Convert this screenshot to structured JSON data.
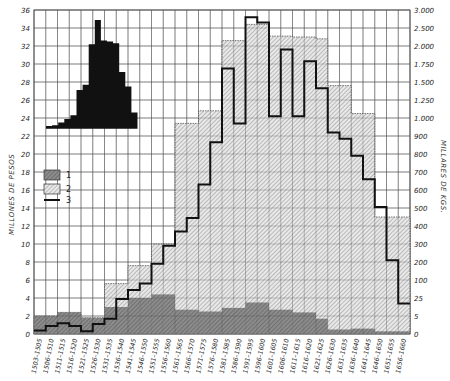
{
  "chart_data": {
    "type": "bar",
    "title": "",
    "xlabel": "",
    "ylabel": "MILLONES DE PESOS",
    "ylabel_right": "MILLARES DE KGS.",
    "ylim": [
      0,
      36
    ],
    "grid": true,
    "y_ticks_left": [
      "0",
      "2",
      "4",
      "6",
      "8",
      "10",
      "12",
      "14",
      "16",
      "18",
      "20",
      "22",
      "24",
      "26",
      "28",
      "30",
      "32",
      "34",
      "36"
    ],
    "y_ticks_right": [
      "0",
      "5",
      "25",
      "100",
      "200",
      "300",
      "400",
      "500",
      "600",
      "700",
      "800",
      "900",
      "1.000",
      "1.250",
      "1.500",
      "1.750",
      "2.000",
      "2.500",
      "3.000"
    ],
    "categories": [
      "1503-1505",
      "1506-1510",
      "1511-1515",
      "1516-1520",
      "1521-1525",
      "1526-1530",
      "1531-1535",
      "1536-1540",
      "1541-1545",
      "1546-1550",
      "1551-1555",
      "1556-1560",
      "1561-1565",
      "1566-1570",
      "1571-1575",
      "1576-1580",
      "1581-1585",
      "1586-1590",
      "1591-1595",
      "1596-1600",
      "1601-1605",
      "1606-1610",
      "1611-1615",
      "1616-1620",
      "1621-1625",
      "1626-1630",
      "1631-1635",
      "1636-1640",
      "1641-1645",
      "1646-1650",
      "1651-1655",
      "1656-1660"
    ],
    "legend": [
      {
        "key": "1",
        "style": "stippled-dark"
      },
      {
        "key": "2",
        "style": "hatched-light"
      },
      {
        "key": "3",
        "style": "thick-line"
      }
    ],
    "series": [
      {
        "name": "1",
        "values": [
          2,
          2,
          2.4,
          2.4,
          1.8,
          1.8,
          3,
          3,
          4,
          4,
          4.4,
          4.4,
          2.7,
          2.7,
          2.5,
          2.5,
          2.9,
          2.9,
          3.5,
          3.5,
          2.7,
          2.7,
          2.4,
          2.4,
          1.7,
          0.5,
          0.5,
          0.6,
          0.6,
          0.3,
          0.3,
          0.3
        ]
      },
      {
        "name": "2",
        "values": [
          2,
          2,
          2.4,
          2.4,
          1.8,
          1.8,
          5.6,
          5.6,
          7.6,
          7.6,
          10,
          10,
          23.4,
          23.4,
          24.8,
          24.8,
          32.6,
          32.6,
          34.4,
          34.4,
          33.1,
          33.1,
          33,
          33,
          32.8,
          27.6,
          27.6,
          24.5,
          24.5,
          13,
          13,
          13
        ]
      },
      {
        "name": "3",
        "values": [
          0.4,
          0.9,
          1.2,
          0.9,
          0.3,
          1.1,
          1.7,
          3.9,
          4.9,
          5.6,
          7.8,
          9.8,
          11.4,
          12.9,
          16.6,
          21.3,
          29.5,
          23.4,
          35.2,
          34.6,
          24.2,
          31.6,
          24.2,
          30.3,
          27.3,
          22.4,
          21.7,
          19.8,
          17.2,
          14.1,
          8.2,
          3.4
        ]
      }
    ],
    "inset": {
      "type": "bar",
      "description": "black histogram silhouette (inset, no axis labels)",
      "values": [
        23.1,
        23.2,
        23.5,
        23.9,
        24.3,
        27.1,
        27.7,
        32.2,
        34.9,
        32.6,
        32.5,
        32.3,
        29.1,
        27.5,
        24.6
      ]
    }
  },
  "legend_labels": {
    "s1": "1",
    "s2": "2",
    "s3": "3"
  }
}
